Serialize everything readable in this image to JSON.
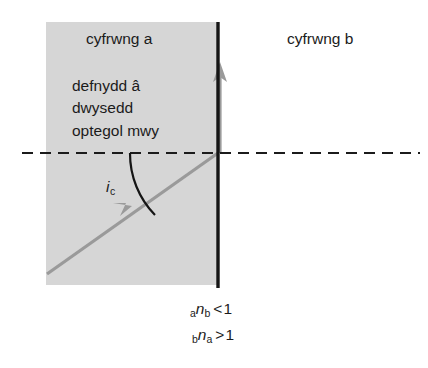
{
  "diagram": {
    "title_labels": {
      "medium_a": "cyfrwng a",
      "medium_b": "cyfrwng b"
    },
    "material_description": [
      "defnydd â",
      "dwysedd",
      "optegol mwy"
    ],
    "critical_angle": {
      "symbol": "i",
      "subscript": "c"
    },
    "formulas": [
      {
        "leading_sub": "a",
        "symbol": "n",
        "trailing_sub": "b",
        "relation": "<",
        "value": "1"
      },
      {
        "leading_sub": "b",
        "symbol": "n",
        "trailing_sub": "a",
        "relation": ">",
        "value": "1"
      }
    ],
    "colors": {
      "medium_a_fill": "#d6d6d6",
      "boundary_line": "#151515",
      "ray": "#9a9a9a",
      "normal_dashed": "#1b1b1b",
      "arc": "#151515",
      "background": "#ffffff",
      "text": "#1b1b1b"
    },
    "geometry": {
      "medium_a_rect": {
        "x": 46,
        "y": 22,
        "width": 172,
        "height": 263
      },
      "boundary_x": 218,
      "boundary_y_top": 22,
      "boundary_y_bottom": 288,
      "normal_line_y": 153,
      "normal_line_x_start": 22,
      "normal_line_x_end": 420,
      "incident_ray_start": {
        "x": 47,
        "y": 274
      },
      "incident_ray_end": {
        "x": 218,
        "y": 153
      },
      "reflected_ray_start": {
        "x": 219,
        "y": 153
      },
      "reflected_ray_end": {
        "x": 219,
        "y": 64
      },
      "arc_radius": 88
    }
  }
}
